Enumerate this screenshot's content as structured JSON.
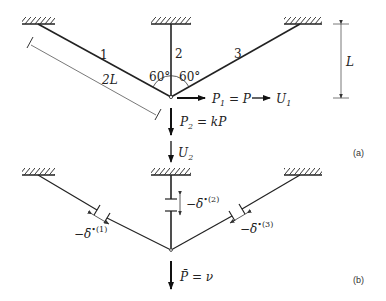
{
  "figure": {
    "panel_a": {
      "tag": "(a)",
      "members": [
        {
          "id": "member-1",
          "label": "1"
        },
        {
          "id": "member-2",
          "label": "2"
        },
        {
          "id": "member-3",
          "label": "3"
        }
      ],
      "angles": [
        "60°",
        "60°"
      ],
      "dimensions": {
        "diagonal_length": "2L",
        "height": "L"
      },
      "loads": {
        "p1_lhs": "P",
        "p1_sub": "1",
        "p1_rhs": " = P",
        "u1": "U",
        "u1_sub": "1",
        "p2": "P",
        "p2_sub": "2",
        "p2_rhs": " = kP",
        "u2": "U",
        "u2_sub": "2"
      }
    },
    "panel_b": {
      "tag": "(b)",
      "gaps": [
        {
          "member": "1",
          "label": "−δ̄",
          "sup": "•(1)"
        },
        {
          "member": "2",
          "label": "−δ̄",
          "sup": "•(2)"
        },
        {
          "member": "3",
          "label": "−δ̄",
          "sup": "•(3)"
        }
      ],
      "load": {
        "lhs": "P̄",
        "rhs": " = ν"
      }
    }
  }
}
